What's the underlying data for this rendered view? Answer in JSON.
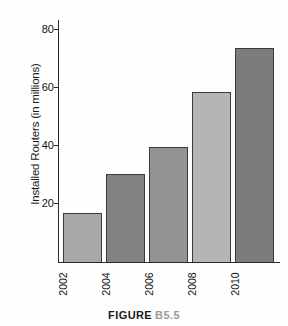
{
  "chart_data": {
    "type": "bar",
    "title": "",
    "subtitle": "",
    "categories": [
      "2002",
      "2004",
      "2006",
      "2008",
      "2010"
    ],
    "values": [
      18,
      32,
      42,
      62,
      78
    ],
    "xlabel": "",
    "ylabel": "Installed Routers (in millions)",
    "ylim": [
      0,
      88
    ],
    "yticks": [
      20,
      40,
      60,
      80
    ],
    "ytick_labels": [
      "20",
      "40",
      "60",
      "80"
    ],
    "xtick_labels": [
      "2002",
      "2004",
      "2006",
      "2008",
      "2010"
    ],
    "grid": false,
    "legend": false,
    "legend_position": "none",
    "annotations": [],
    "bar_colors": [
      "#a9a9a9",
      "#838383",
      "#949494",
      "#b5b5b5",
      "#7c7c7c"
    ],
    "bar_edge_color": "#3a3a3a",
    "axis_color": "#2a2a2a",
    "background_color": "#ffffff"
  },
  "caption": {
    "label": "FIGURE",
    "number": "B5.5"
  }
}
